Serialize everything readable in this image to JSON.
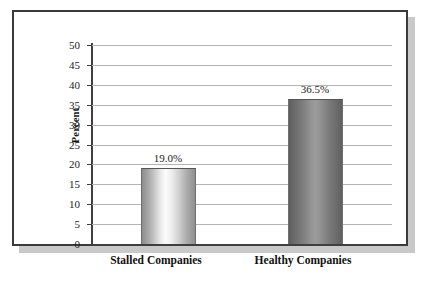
{
  "figure": {
    "frame_color": "#3a3a3a",
    "shadow_color": "#c9c9c9",
    "background": "#ffffff"
  },
  "chart_data": {
    "type": "bar",
    "title": "",
    "subtitle": "",
    "xlabel": "",
    "ylabel": "Percent",
    "categories": [
      "Stalled Companies",
      "Healthy Companies"
    ],
    "values": [
      19.0,
      36.5
    ],
    "value_labels": [
      "19.0%",
      "36.5%"
    ],
    "series": [
      {
        "name": "Percent",
        "values": [
          19.0,
          36.5
        ]
      }
    ],
    "ylim": [
      0,
      50
    ],
    "ytick_step": 5,
    "ytick_labels": [
      "0",
      "5",
      "10",
      "15",
      "20",
      "25",
      "30",
      "35",
      "40",
      "45",
      "50"
    ],
    "ytick_values": [
      0,
      5,
      10,
      15,
      20,
      25,
      30,
      35,
      40,
      45,
      50
    ],
    "grid": true,
    "grid_axis": "y",
    "grid_color": "#b4b4b4",
    "legend": false,
    "legend_position": "none",
    "bar_styles": [
      {
        "category": "Stalled Companies",
        "fill": "cylinder-gradient-light",
        "highlight_color": "#fbfbfb",
        "edge_color": "#8d8d8d"
      },
      {
        "category": "Healthy Companies",
        "fill": "cylinder-gradient-dark",
        "highlight_color": "#9c9c9c",
        "edge_color": "#5d5d5d"
      }
    ]
  }
}
